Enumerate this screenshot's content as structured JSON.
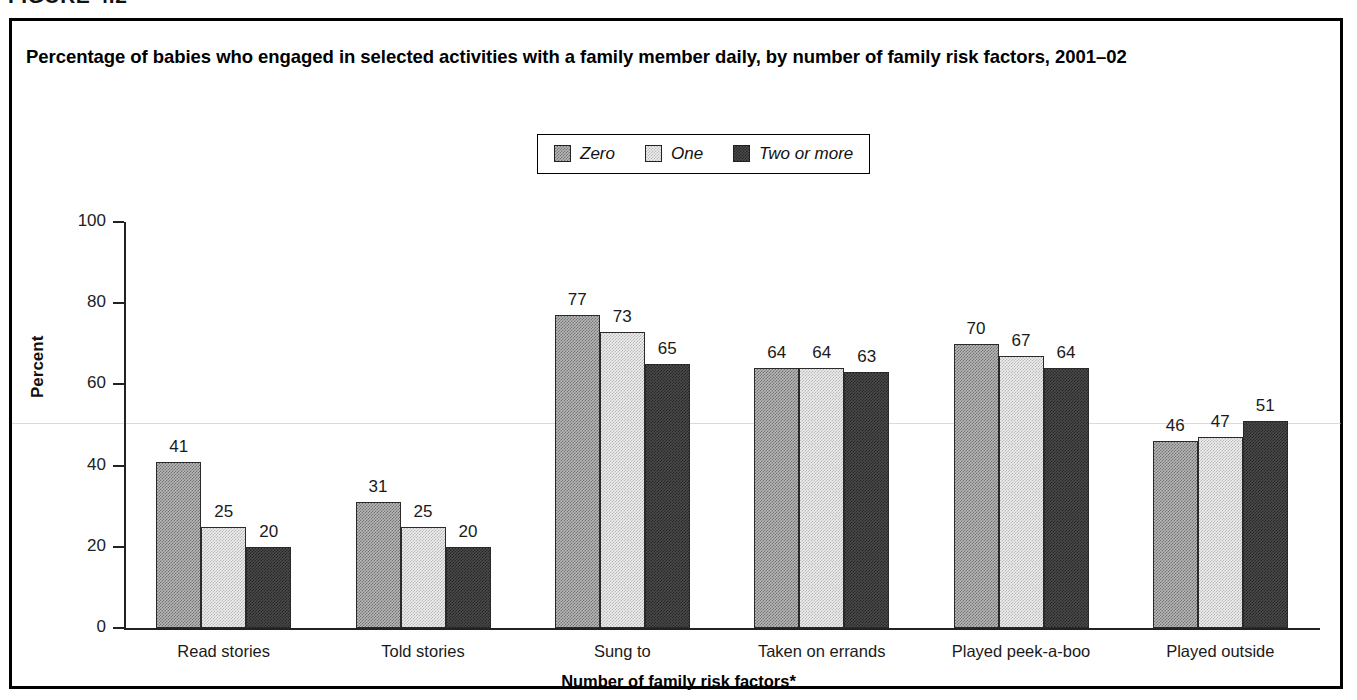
{
  "figure": {
    "label": "FIGURE 4.2"
  },
  "chart_title": "Percentage of babies who engaged in selected activities with a family member daily, by number of family risk factors, 2001–02",
  "axes": {
    "y_title": "Percent",
    "x_title": "Number of family risk factors*",
    "y_ticks": [
      "0",
      "20",
      "40",
      "60",
      "80",
      "100"
    ]
  },
  "legend": {
    "items": [
      {
        "label": "Zero",
        "swatch": "medium-gray-dither",
        "color": "#b8b8b8"
      },
      {
        "label": "One",
        "swatch": "light-gray-dither",
        "color": "#ededed"
      },
      {
        "label": "Two or more",
        "swatch": "dark-gray-dither",
        "color": "#4b4b4b"
      }
    ]
  },
  "chart_data": {
    "type": "bar",
    "title": "Percentage of babies who engaged in selected activities with a family member daily, by number of family risk factors, 2001–02",
    "xlabel": "Number of family risk factors*",
    "ylabel": "Percent",
    "ylim": [
      0,
      100
    ],
    "yticks": [
      0,
      20,
      40,
      60,
      80,
      100
    ],
    "grid": false,
    "legend_position": "top-center",
    "categories": [
      "Read stories",
      "Told stories",
      "Sung to",
      "Taken on errands",
      "Played peek-a-boo",
      "Played outside"
    ],
    "series": [
      {
        "name": "Zero",
        "color": "#b8b8b8",
        "values": [
          41,
          31,
          77,
          64,
          70,
          46
        ]
      },
      {
        "name": "One",
        "color": "#ededed",
        "values": [
          25,
          25,
          73,
          64,
          67,
          47
        ]
      },
      {
        "name": "Two or more",
        "color": "#4b4b4b",
        "values": [
          20,
          20,
          65,
          63,
          64,
          51
        ]
      }
    ]
  }
}
